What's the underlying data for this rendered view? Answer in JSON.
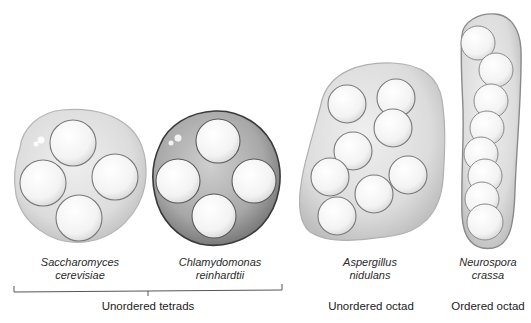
{
  "figure": {
    "organisms": [
      {
        "id": "saccharomyces",
        "genus": "Saccharomyces",
        "species": "cerevisiae",
        "spore_count": 4,
        "arrangement": "unordered tetrad"
      },
      {
        "id": "chlamydomonas",
        "genus": "Chlamydomonas",
        "species": "reinhardtii",
        "spore_count": 4,
        "arrangement": "unordered tetrad"
      },
      {
        "id": "aspergillus",
        "genus": "Aspergillus",
        "species": "nidulans",
        "spore_count": 8,
        "arrangement": "unordered octad"
      },
      {
        "id": "neurospora",
        "genus": "Neurospora",
        "species": "crassa",
        "spore_count": 8,
        "arrangement": "ordered octad"
      }
    ],
    "categories": {
      "unordered_tetrads": "Unordered tetrads",
      "unordered_octad": "Unordered octad",
      "ordered_octad": "Ordered octad"
    },
    "colors": {
      "light_ascus": "#d9d9d9",
      "dark_ascus": "#8a8a8a",
      "spore": "#f7f7f7",
      "outline": "#7a7a7a"
    }
  }
}
